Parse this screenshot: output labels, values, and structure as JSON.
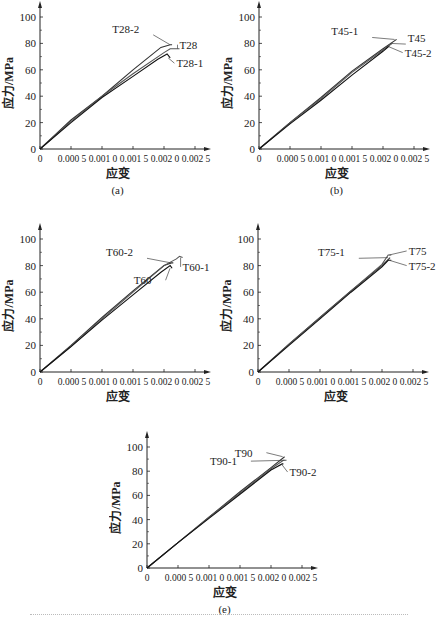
{
  "figure": {
    "footer_text_visible": false
  },
  "chart_data": [
    {
      "id": "a",
      "type": "line",
      "caption": "(a)",
      "xlabel": "应变",
      "ylabel": "应力/MPa",
      "xlim": [
        0,
        0.0025
      ],
      "ylim": [
        0,
        100
      ],
      "xticks": [
        "0",
        "0.000 5",
        "0.001 0",
        "0.001 5",
        "0.002 0",
        "0.002 5"
      ],
      "yticks": [
        "0",
        "20",
        "40",
        "60",
        "80",
        "100"
      ],
      "grid": false,
      "series": [
        {
          "name": "T28-2",
          "points": [
            [
              0,
              0
            ],
            [
              0.0005,
              22
            ],
            [
              0.001,
              40
            ],
            [
              0.0015,
              60
            ],
            [
              0.00195,
              77
            ],
            [
              0.0021,
              79
            ],
            [
              0.00213,
              79
            ]
          ]
        },
        {
          "name": "T28",
          "points": [
            [
              0,
              0
            ],
            [
              0.0005,
              21
            ],
            [
              0.001,
              40
            ],
            [
              0.0015,
              57
            ],
            [
              0.002,
              73
            ],
            [
              0.0021,
              76
            ],
            [
              0.00225,
              76
            ]
          ]
        },
        {
          "name": "T28-1",
          "points": [
            [
              0,
              0
            ],
            [
              0.0005,
              20
            ],
            [
              0.001,
              39
            ],
            [
              0.0015,
              55
            ],
            [
              0.0019,
              68
            ],
            [
              0.00205,
              72
            ],
            [
              0.0021,
              69
            ]
          ]
        }
      ],
      "annotations": [
        {
          "text": "T28-2",
          "x": 0.0016,
          "y": 88
        },
        {
          "text": "T28",
          "x": 0.00225,
          "y": 76
        },
        {
          "text": "T28-1",
          "x": 0.0022,
          "y": 62
        }
      ]
    },
    {
      "id": "b",
      "type": "line",
      "caption": "(b)",
      "xlabel": "应变",
      "ylabel": "应力/MPa",
      "xlim": [
        0,
        0.0025
      ],
      "ylim": [
        0,
        100
      ],
      "xticks": [
        "0",
        "0.000 5",
        "0.001 0",
        "0.001 5",
        "0.002 0",
        "0.002 5"
      ],
      "yticks": [
        "0",
        "20",
        "40",
        "60",
        "80",
        "100"
      ],
      "grid": false,
      "series": [
        {
          "name": "T45-1",
          "points": [
            [
              0,
              0
            ],
            [
              0.0005,
              20
            ],
            [
              0.001,
              39
            ],
            [
              0.0015,
              59
            ],
            [
              0.002,
              76
            ],
            [
              0.00222,
              83
            ]
          ]
        },
        {
          "name": "T45",
          "points": [
            [
              0,
              0
            ],
            [
              0.0005,
              20
            ],
            [
              0.001,
              38
            ],
            [
              0.0015,
              58
            ],
            [
              0.002,
              75
            ],
            [
              0.00215,
              80
            ]
          ]
        },
        {
          "name": "T45-2",
          "points": [
            [
              0,
              0
            ],
            [
              0.0005,
              19
            ],
            [
              0.001,
              37
            ],
            [
              0.0015,
              56
            ],
            [
              0.002,
              74
            ],
            [
              0.0021,
              78
            ]
          ]
        }
      ],
      "annotations": [
        {
          "text": "T45-1",
          "x": 0.0016,
          "y": 86
        },
        {
          "text": "T45",
          "x": 0.0024,
          "y": 81
        },
        {
          "text": "T45-2",
          "x": 0.00235,
          "y": 70
        }
      ]
    },
    {
      "id": "c",
      "type": "line",
      "caption": "(c)",
      "xlabel": "应变",
      "ylabel": "应力/MPa",
      "xlim": [
        0,
        0.0025
      ],
      "ylim": [
        0,
        100
      ],
      "xticks": [
        "0",
        "0.000 5",
        "0.001 0",
        "0.001 5",
        "0.002 0",
        "0.002 5"
      ],
      "yticks": [
        "0",
        "20",
        "40",
        "60",
        "80",
        "100"
      ],
      "grid": false,
      "series": [
        {
          "name": "T60-2",
          "points": [
            [
              0,
              0
            ],
            [
              0.0005,
              20
            ],
            [
              0.001,
              41
            ],
            [
              0.0015,
              61
            ],
            [
              0.002,
              80
            ],
            [
              0.00212,
              82
            ],
            [
              0.00215,
              82
            ]
          ]
        },
        {
          "name": "T60-1",
          "points": [
            [
              0,
              0
            ],
            [
              0.0005,
              19
            ],
            [
              0.001,
              40
            ],
            [
              0.0015,
              60
            ],
            [
              0.002,
              80
            ],
            [
              0.0022,
              85
            ],
            [
              0.00225,
              87
            ],
            [
              0.0023,
              86
            ]
          ]
        },
        {
          "name": "T60",
          "points": [
            [
              0,
              0
            ],
            [
              0.0005,
              19
            ],
            [
              0.001,
              39
            ],
            [
              0.0015,
              58
            ],
            [
              0.00195,
              75
            ],
            [
              0.0021,
              80
            ],
            [
              0.00213,
              78
            ]
          ]
        }
      ],
      "annotations": [
        {
          "text": "T60-2",
          "x": 0.0015,
          "y": 87
        },
        {
          "text": "T60-1",
          "x": 0.0023,
          "y": 76
        },
        {
          "text": "T60",
          "x": 0.0018,
          "y": 66
        }
      ]
    },
    {
      "id": "d",
      "type": "line",
      "caption": "(d)",
      "xlabel": "应变",
      "ylabel": "应力/MPa",
      "xlim": [
        0,
        0.0025
      ],
      "ylim": [
        0,
        100
      ],
      "xticks": [
        "0",
        "0.000 5",
        "0.001 0",
        "0.001 5",
        "0.002 0",
        "0.002 5"
      ],
      "yticks": [
        "0",
        "20",
        "40",
        "60",
        "80",
        "100"
      ],
      "grid": false,
      "series": [
        {
          "name": "T75-1",
          "points": [
            [
              0,
              0
            ],
            [
              0.0005,
              21
            ],
            [
              0.001,
              41
            ],
            [
              0.0015,
              61
            ],
            [
              0.002,
              80
            ],
            [
              0.00213,
              86
            ]
          ]
        },
        {
          "name": "T75",
          "points": [
            [
              0,
              0
            ],
            [
              0.0005,
              21
            ],
            [
              0.001,
              41
            ],
            [
              0.0015,
              61
            ],
            [
              0.002,
              81
            ],
            [
              0.0021,
              88
            ],
            [
              0.00215,
              88
            ]
          ]
        },
        {
          "name": "T75-2",
          "points": [
            [
              0,
              0
            ],
            [
              0.0005,
              20
            ],
            [
              0.001,
              40
            ],
            [
              0.0015,
              60
            ],
            [
              0.002,
              79
            ],
            [
              0.0021,
              84
            ],
            [
              0.00215,
              84
            ]
          ]
        }
      ],
      "annotations": [
        {
          "text": "T75-1",
          "x": 0.0014,
          "y": 87
        },
        {
          "text": "T75",
          "x": 0.00243,
          "y": 88
        },
        {
          "text": "T75-2",
          "x": 0.00243,
          "y": 77
        }
      ]
    },
    {
      "id": "e",
      "type": "line",
      "caption": "(e)",
      "xlabel": "应变",
      "ylabel": "应力/MPa",
      "xlim": [
        0,
        0.0025
      ],
      "ylim": [
        0,
        100
      ],
      "xticks": [
        "0",
        "0.000 5",
        "0.001 0",
        "0.001 5",
        "0.002 0",
        "0.002 5"
      ],
      "yticks": [
        "0",
        "20",
        "40",
        "60",
        "80",
        "100"
      ],
      "grid": false,
      "series": [
        {
          "name": "T90",
          "points": [
            [
              0,
              0
            ],
            [
              0.0005,
              21
            ],
            [
              0.001,
              42
            ],
            [
              0.0015,
              63
            ],
            [
              0.002,
              83
            ],
            [
              0.00222,
              92
            ]
          ]
        },
        {
          "name": "T90-1",
          "points": [
            [
              0,
              0
            ],
            [
              0.0005,
              21
            ],
            [
              0.001,
              42
            ],
            [
              0.0015,
              62
            ],
            [
              0.002,
              82
            ],
            [
              0.0022,
              89
            ],
            [
              0.00225,
              89
            ]
          ]
        },
        {
          "name": "T90-2",
          "points": [
            [
              0,
              0
            ],
            [
              0.0005,
              21
            ],
            [
              0.001,
              41
            ],
            [
              0.0015,
              61
            ],
            [
              0.002,
              81
            ],
            [
              0.00218,
              86
            ],
            [
              0.0022,
              86
            ]
          ]
        }
      ],
      "annotations": [
        {
          "text": "T90",
          "x": 0.0017,
          "y": 92
        },
        {
          "text": "T90-1",
          "x": 0.00145,
          "y": 85
        },
        {
          "text": "T90-2",
          "x": 0.0023,
          "y": 76
        }
      ]
    }
  ]
}
